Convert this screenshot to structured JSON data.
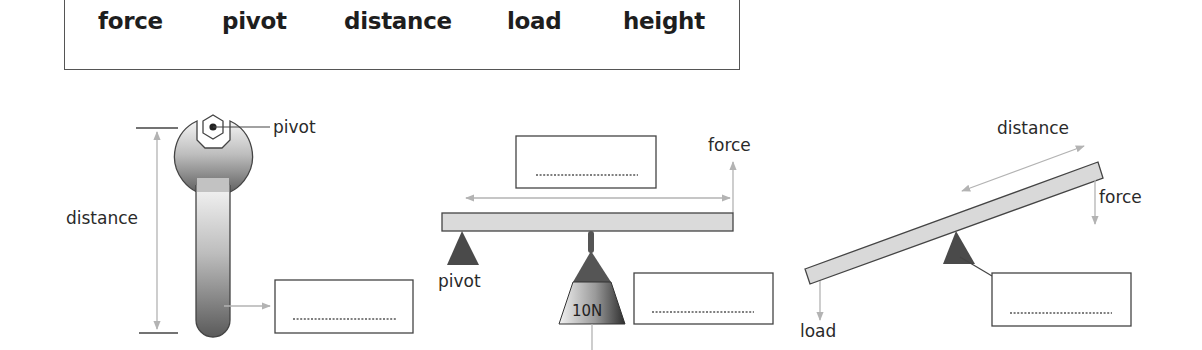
{
  "word_bank": {
    "words": [
      "force",
      "pivot",
      "distance",
      "load",
      "height"
    ]
  },
  "diagrams": {
    "spanner": {
      "labels": {
        "pivot": "pivot",
        "distance": "distance"
      },
      "answer_box": {
        "value": "",
        "placeholder": "...................."
      }
    },
    "balance_beam": {
      "labels": {
        "force": "force",
        "pivot": "pivot",
        "weight": "10N"
      },
      "answer_box_top": {
        "value": "",
        "placeholder": "...................."
      },
      "answer_box_right": {
        "value": "",
        "placeholder": "...................."
      }
    },
    "seesaw": {
      "labels": {
        "distance": "distance",
        "force": "force",
        "load": "load"
      },
      "answer_box": {
        "value": "",
        "placeholder": "...................."
      }
    }
  },
  "colors": {
    "outline": "#444444",
    "arrow": "#b3b3b3",
    "beam_fill": "#d9d9d9",
    "pivot_fill": "#4a4a4a",
    "text": "#2a2a2a"
  }
}
